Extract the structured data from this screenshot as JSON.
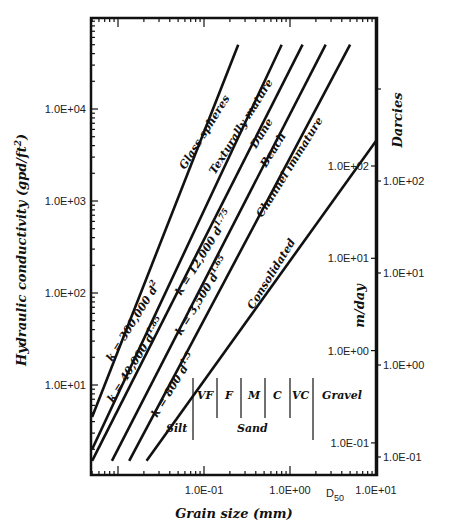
{
  "chart_data": {
    "type": "line",
    "title": "",
    "xlabel": "Grain size (mm)",
    "ylabel": "Hydraulic conductivity (gpd/ft2)",
    "ylabel_main": "Hydraulic conductivity (gpd/ft",
    "ylabel_sup": "2",
    "ylabel_close": ")",
    "xscale": "log",
    "yscale": "log",
    "xlim": [
      0.005,
      10
    ],
    "ylim": [
      1.5,
      50000
    ],
    "x_ticks": [
      {
        "value": 0.1,
        "label": "1.0E-01"
      },
      {
        "value": 1,
        "label": "1.0E+00"
      },
      {
        "value": 10,
        "label": "1.0E+01"
      }
    ],
    "x_extra_label": "D",
    "x_extra_sub": "50",
    "y_ticks": [
      {
        "value": 10,
        "label": "1.0E+01"
      },
      {
        "value": 100,
        "label": "1.0E+02"
      },
      {
        "value": 1000,
        "label": "1.0E+03"
      },
      {
        "value": 10000,
        "label": "1.0E+04"
      }
    ],
    "secondary_axes": [
      {
        "name": "m/day",
        "ticks": [
          {
            "value": 100,
            "label": "1.0E+02"
          },
          {
            "value": 10,
            "label": "1.0E+01"
          },
          {
            "value": 1,
            "label": "1.0E+00"
          },
          {
            "value": 0.1,
            "label": "1.0E-01"
          }
        ]
      },
      {
        "name": "Darcies",
        "ticks": [
          {
            "value": 100,
            "label": "1.0E+02"
          },
          {
            "value": 10,
            "label": "1.0E+01"
          },
          {
            "value": 1,
            "label": "1.0E+00"
          },
          {
            "value": 0.1,
            "label": "1.0E-01"
          }
        ]
      }
    ],
    "series": [
      {
        "name": "Glass spheres",
        "formula_k": "k = 300,000 d",
        "formula_exp": "2",
        "exponent": 2,
        "coef": 300000,
        "points": [
          [
            0.005,
            4.5
          ],
          [
            0.25,
            50000
          ]
        ]
      },
      {
        "name": "Texturally mature",
        "formula_k": "k = 40,000 d",
        "formula_exp": "1.85",
        "exponent": 1.85,
        "coef": 40000,
        "points": [
          [
            0.005,
            2.0
          ],
          [
            0.8,
            50000
          ]
        ]
      },
      {
        "name": "Dune",
        "formula_k": "k = 12,000 d",
        "formula_exp": "1.75",
        "exponent": 1.75,
        "coef": 12000,
        "points": [
          [
            0.005,
            1.5
          ],
          [
            1.4,
            50000
          ]
        ]
      },
      {
        "name": "Beach",
        "formula_k": "k = 3,500 d",
        "formula_exp": "1.65",
        "exponent": 1.65,
        "coef": 3500,
        "points": [
          [
            0.0085,
            1.5
          ],
          [
            2.6,
            50000
          ]
        ]
      },
      {
        "name": "Channel immature",
        "formula_k": "",
        "formula_exp": "",
        "exponent": 1.6,
        "coef": 2000,
        "points": [
          [
            0.0135,
            1.5
          ],
          [
            5.0,
            50000
          ]
        ]
      },
      {
        "name": "Consolidated",
        "formula_k": "k = 800 d",
        "formula_exp": "1.5",
        "exponent": 1.5,
        "coef": 800,
        "points": [
          [
            0.0215,
            1.5
          ],
          [
            10,
            4500
          ]
        ]
      }
    ],
    "grain_classes": {
      "silt": "Silt",
      "sand": "Sand",
      "gravel": "Gravel",
      "sand_subclasses": [
        "VF",
        "F",
        "M",
        "C",
        "VC"
      ]
    },
    "grid": false,
    "legend": "none"
  }
}
